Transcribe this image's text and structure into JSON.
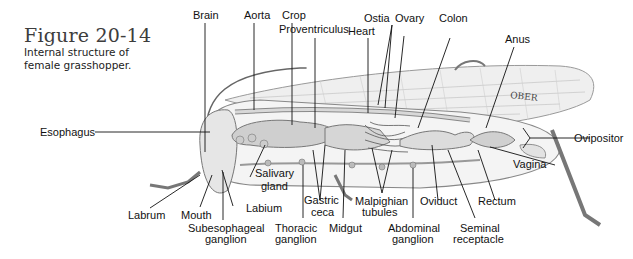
{
  "figure": {
    "number": "Figure 20-14",
    "caption_line1": "Internal structure of",
    "caption_line2": "female grasshopper."
  },
  "wing_text": "OBER",
  "labels": {
    "brain": "Brain",
    "aorta": "Aorta",
    "crop": "Crop",
    "proventriculus": "Proventriculus",
    "heart": "Heart",
    "ostia": "Ostia",
    "ovary": "Ovary",
    "colon": "Colon",
    "anus": "Anus",
    "esophagus": "Esophagus",
    "ovipositor": "Ovipositor",
    "vagina": "Vagina",
    "salivary_1": "Salivary",
    "salivary_2": "gland",
    "labrum": "Labrum",
    "mouth": "Mouth",
    "labium": "Labium",
    "subesophageal_1": "Subesophageal",
    "subesophageal_2": "ganglion",
    "gastric_1": "Gastric",
    "gastric_2": "ceca",
    "thoracic_1": "Thoracic",
    "thoracic_2": "ganglion",
    "midgut": "Midgut",
    "malpighian_1": "Malpighian",
    "malpighian_2": "tubules",
    "abdominal_1": "Abdominal",
    "abdominal_2": "ganglion",
    "oviduct": "Oviduct",
    "seminal_1": "Seminal",
    "seminal_2": "receptacle",
    "rectum": "Rectum"
  }
}
